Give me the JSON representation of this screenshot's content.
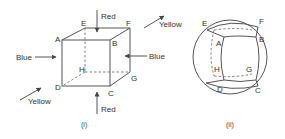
{
  "figure_i": {
    "caption": "(i)",
    "vertices": {
      "A": "A",
      "B": "B",
      "C": "C",
      "D": "D",
      "E": "E",
      "F": "F",
      "G": "G",
      "H": "H"
    },
    "forces": {
      "red_top": "Red",
      "red_bottom": "Red",
      "blue_left": "Blue",
      "blue_right": "Blue",
      "yellow_top_right": "Yellow",
      "yellow_bottom_left": "Yellow"
    }
  },
  "figure_ii": {
    "caption": "(ii)",
    "vertices": {
      "A": "A",
      "B": "B",
      "C": "C",
      "D": "D",
      "E": "E",
      "F": "F",
      "G": "G",
      "H": "H"
    }
  }
}
